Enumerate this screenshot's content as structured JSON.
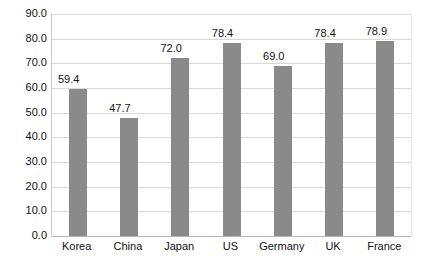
{
  "chart_data": {
    "type": "bar",
    "title": "",
    "subtitle": "",
    "xlabel": "",
    "ylabel": "",
    "categories": [
      "Korea",
      "China",
      "Japan",
      "US",
      "Germany",
      "UK",
      "France"
    ],
    "values": [
      59.4,
      47.7,
      72.0,
      78.4,
      69.0,
      78.4,
      78.9
    ],
    "data_labels": [
      "59.4",
      "47.7",
      "72.0",
      "78.4",
      "69.0",
      "78.4",
      "78.9"
    ],
    "ylim": [
      0,
      90
    ],
    "ytick_values": [
      90,
      80,
      70,
      60,
      50,
      40,
      30,
      20,
      10,
      0
    ],
    "ytick_labels": [
      "90.0",
      "80.0",
      "70.0",
      "60.0",
      "50.0",
      "40.0",
      "30.0",
      "20.0",
      "10.0",
      "0.0"
    ],
    "grid": true,
    "legend": false,
    "legend_position": "none",
    "series_name": "",
    "colors": {
      "bar": "#8a8a8a",
      "gridline": "#d9d9d9",
      "axis": "#b5b5b5",
      "text": "#111111",
      "background": "#ffffff"
    }
  }
}
